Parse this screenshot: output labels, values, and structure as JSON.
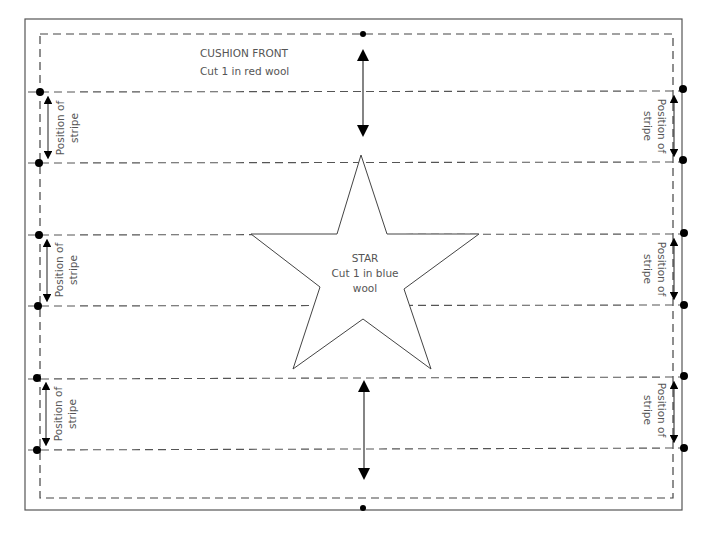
{
  "pattern": {
    "title": "CUSHION FRONT",
    "subtitle": "Cut 1 in red wool",
    "star_label_line1": "STAR",
    "star_label_line2": "Cut 1 in blue",
    "star_label_line3": "wool",
    "stripe_label_line1": "Position of",
    "stripe_label_line2": "stripe"
  },
  "stripes": [
    {
      "top": 92,
      "bottom": 163
    },
    {
      "top": 235,
      "bottom": 306
    },
    {
      "top": 379,
      "bottom": 450
    }
  ],
  "colors": {
    "line": "#444444",
    "dash": "#555555",
    "text": "#555555",
    "marker": "#000000"
  }
}
